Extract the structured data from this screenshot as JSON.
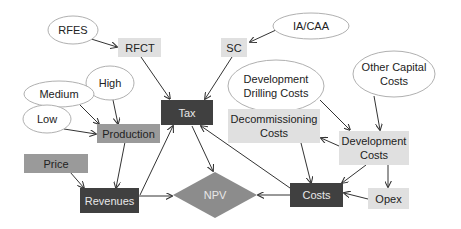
{
  "colors": {
    "dark_box": "#404040",
    "mid_box": "#9a9a9a",
    "light_box": "#e0e0e0",
    "diamond": "#8c8c8c",
    "ellipse_fill": "#ffffff",
    "ellipse_stroke": "#b0b0b0",
    "edge": "#333333"
  },
  "nodes": {
    "rfes": {
      "label": "RFES",
      "shape": "ellipse"
    },
    "rfct": {
      "label": "RFCT",
      "shape": "box-light"
    },
    "sc": {
      "label": "SC",
      "shape": "box-light"
    },
    "ia_caa": {
      "label": "IA/CAA",
      "shape": "ellipse"
    },
    "tax": {
      "label": "Tax",
      "shape": "box-dark"
    },
    "medium": {
      "label": "Medium",
      "shape": "ellipse"
    },
    "high": {
      "label": "High",
      "shape": "ellipse"
    },
    "low": {
      "label": "Low",
      "shape": "ellipse"
    },
    "production": {
      "label": "Production",
      "shape": "box-mid"
    },
    "price": {
      "label": "Price",
      "shape": "box-mid"
    },
    "revenues": {
      "label": "Revenues",
      "shape": "box-dark"
    },
    "npv": {
      "label": "NPV",
      "shape": "diamond"
    },
    "dev_drilling": {
      "label_line1": "Development",
      "label_line2": "Drilling Costs",
      "shape": "ellipse"
    },
    "other_capital": {
      "label_line1": "Other Capital",
      "label_line2": "Costs",
      "shape": "ellipse"
    },
    "decommissioning": {
      "label_line1": "Decommissioning",
      "label_line2": "Costs",
      "shape": "box-light"
    },
    "dev_costs": {
      "label_line1": "Development",
      "label_line2": "Costs",
      "shape": "box-light"
    },
    "costs": {
      "label": "Costs",
      "shape": "box-dark"
    },
    "opex": {
      "label": "Opex",
      "shape": "box-light"
    }
  },
  "edges": [
    {
      "from": "RFES",
      "to": "RFCT"
    },
    {
      "from": "RFCT",
      "to": "Tax"
    },
    {
      "from": "IA/CAA",
      "to": "SC"
    },
    {
      "from": "SC",
      "to": "Tax"
    },
    {
      "from": "Medium",
      "to": "Production"
    },
    {
      "from": "High",
      "to": "Production"
    },
    {
      "from": "Low",
      "to": "Production"
    },
    {
      "from": "Production",
      "to": "Revenues"
    },
    {
      "from": "Price",
      "to": "Revenues"
    },
    {
      "from": "Revenues",
      "to": "Tax"
    },
    {
      "from": "Revenues",
      "to": "NPV"
    },
    {
      "from": "Tax",
      "to": "NPV"
    },
    {
      "from": "Costs",
      "to": "Tax"
    },
    {
      "from": "Costs",
      "to": "NPV"
    },
    {
      "from": "Development Drilling Costs",
      "to": "Development Costs"
    },
    {
      "from": "Other Capital Costs",
      "to": "Development Costs"
    },
    {
      "from": "Development Costs",
      "to": "Decommissioning Costs"
    },
    {
      "from": "Decommissioning Costs",
      "to": "Costs"
    },
    {
      "from": "Development Costs",
      "to": "Costs"
    },
    {
      "from": "Development Costs",
      "to": "Opex"
    },
    {
      "from": "Opex",
      "to": "Costs"
    }
  ]
}
